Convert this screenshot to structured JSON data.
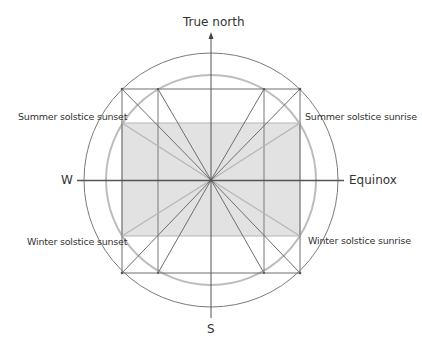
{
  "labels": {
    "north": "True north",
    "south": "S",
    "west": "W",
    "east": "Equinox",
    "summer_sunset": "Summer solstice sunset",
    "summer_sunrise": "Summer solstice sunrise",
    "winter_sunset": "Winter solstice sunset",
    "winter_sunrise": "Winter solstice sunrise"
  },
  "colors": {
    "line": "#6e6e6e",
    "light_line": "#b5b5b5",
    "shade": "#e2e2e2",
    "gray_circle": "#bdbdbd",
    "text": "#333333"
  }
}
